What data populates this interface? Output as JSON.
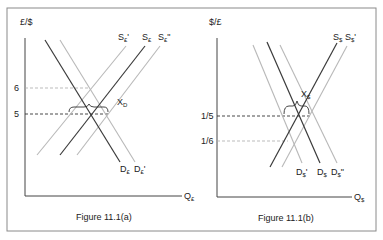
{
  "figure_a": {
    "caption": "Figure 11.1(a)",
    "y_axis_label": "£/$",
    "x_axis_label": {
      "main": "Q",
      "sub": "£"
    },
    "ticks": [
      {
        "label": "6",
        "y": 88
      },
      {
        "label": "5",
        "y": 114
      }
    ],
    "curves": [
      {
        "name": "D",
        "sub": "£",
        "prime": "",
        "style": "dark"
      },
      {
        "name": "D",
        "sub": "£",
        "prime": "'",
        "style": "light"
      },
      {
        "name": "S",
        "sub": "£",
        "prime": "",
        "style": "dark"
      },
      {
        "name": "S",
        "sub": "£",
        "prime": "'",
        "style": "light"
      },
      {
        "name": "S",
        "sub": "£",
        "prime": "\"",
        "style": "light"
      }
    ],
    "bracket_label": {
      "main": "X",
      "sub": "D"
    }
  },
  "figure_b": {
    "caption": "Figure 11.1(b)",
    "y_axis_label": "$/£",
    "x_axis_label": {
      "main": "Q",
      "sub": "$"
    },
    "ticks": [
      {
        "label": "1/5",
        "y": 116
      },
      {
        "label": "1/6",
        "y": 141
      }
    ],
    "curves": [
      {
        "name": "D",
        "sub": "$",
        "prime": "'",
        "style": "light"
      },
      {
        "name": "D",
        "sub": "$",
        "prime": "",
        "style": "dark"
      },
      {
        "name": "D",
        "sub": "$",
        "prime": "\"",
        "style": "light"
      },
      {
        "name": "S",
        "sub": "$",
        "prime": "",
        "style": "dark"
      },
      {
        "name": "S",
        "sub": "$",
        "prime": "'",
        "style": "light"
      }
    ],
    "bracket_label": {
      "main": "X",
      "sub": "$"
    }
  },
  "colors": {
    "dark": "#3a3a3a",
    "light": "#b8b8b8",
    "frame": "#8a8a8a"
  }
}
